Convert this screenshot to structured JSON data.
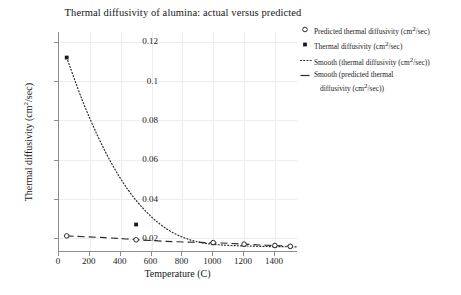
{
  "chart_data": {
    "type": "line",
    "title": "Thermal diffusivity of alumina: actual versus predicted",
    "xlabel": "Temperature (C)",
    "ylabel": "Thermal diffusivity (cm2/sec)",
    "ylabel_base": "Thermal diffusivity (cm",
    "ylabel_sup": "2",
    "ylabel_tail": "/sec)",
    "xlim": [
      0,
      1550
    ],
    "ylim": [
      0.013,
      0.125
    ],
    "grid": true,
    "legend_position": "right",
    "xticks": [
      0,
      200,
      400,
      600,
      800,
      1000,
      1200,
      1400
    ],
    "xtick_labels": [
      "0",
      "200",
      "400",
      "600",
      "800",
      "1000",
      "1200",
      "1400"
    ],
    "yticks": [
      0.02,
      0.04,
      0.06,
      0.08,
      0.1,
      0.12
    ],
    "ytick_labels": [
      "0.02",
      "0.04",
      "0.06",
      "0.08",
      "0.1",
      "0.12"
    ],
    "series": [
      {
        "name": "Thermal diffusivity (cm2/sec)",
        "marker": "filled-square",
        "color": "#1a1a1a",
        "x": [
          50,
          500,
          1000,
          1200,
          1400,
          1500
        ],
        "values": [
          0.112,
          0.027,
          0.0175,
          0.0168,
          0.0162,
          0.0158
        ]
      },
      {
        "name": "Predicted thermal diffusivity (cm2/sec)",
        "marker": "open-circle",
        "color": "#1a1a1a",
        "x": [
          50,
          500,
          1000,
          1200,
          1400,
          1500
        ],
        "values": [
          0.0212,
          0.0192,
          0.0178,
          0.017,
          0.0163,
          0.0159
        ]
      },
      {
        "name": "Smooth (thermal diffusivity (cm2/sec))",
        "marker": "none",
        "line": "dotted",
        "color": "#2b2b2b",
        "x": [
          50,
          150,
          250,
          350,
          450,
          550,
          650,
          750,
          850,
          950,
          1050,
          1150,
          1250,
          1350,
          1450,
          1550
        ],
        "values": [
          0.112,
          0.0905,
          0.0722,
          0.0568,
          0.0444,
          0.0348,
          0.0275,
          0.0224,
          0.0192,
          0.0174,
          0.0166,
          0.0162,
          0.016,
          0.0158,
          0.0157,
          0.0156
        ]
      },
      {
        "name": "Smooth (predicted thermal diffusivity (cm2/sec))",
        "marker": "none",
        "line": "dashed",
        "color": "#2b2b2b",
        "x": [
          50,
          300,
          500,
          700,
          900,
          1000,
          1100,
          1200,
          1300,
          1400,
          1500
        ],
        "values": [
          0.0212,
          0.0203,
          0.0193,
          0.0184,
          0.0179,
          0.0177,
          0.0174,
          0.017,
          0.0166,
          0.0163,
          0.0159
        ]
      }
    ],
    "legend": [
      {
        "label": "Predicted thermal diffusivity (cm",
        "sup": "2",
        "tail": "/sec)",
        "key": "open-circle"
      },
      {
        "label": "Thermal diffusivity (cm",
        "sup": "2",
        "tail": "/sec)",
        "key": "filled-dot"
      },
      {
        "label": "Smooth (thermal diffusivity (cm",
        "sup": "2",
        "tail": "/sec))",
        "key": "dotted-line"
      },
      {
        "label": "Smooth (predicted thermal",
        "sup": "",
        "tail": "",
        "key": "dashed-line",
        "line2_label": "diffusivity (cm",
        "line2_sup": "2",
        "line2_tail": "/sec))"
      }
    ]
  }
}
